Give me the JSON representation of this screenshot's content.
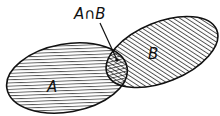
{
  "diagram": {
    "type": "venn",
    "sets": [
      {
        "name": "A",
        "label": "A",
        "pattern": "horizontal-hatch"
      },
      {
        "name": "B",
        "label": "B",
        "pattern": "diagonal-hatch"
      }
    ],
    "intersection": {
      "label": "A∩B",
      "pattern": "cross-hatch"
    },
    "colors": {
      "stroke": "#111111",
      "background": "#ffffff"
    }
  }
}
